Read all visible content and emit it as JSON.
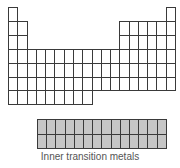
{
  "diagram": {
    "main_table": {
      "columns": 18,
      "rows": 7,
      "origin": {
        "x": 8,
        "y": 7
      },
      "cell_width": 9.28,
      "cell_height": 13.9,
      "cell_fill": "#ffffff",
      "line_color": "#3a3a3a",
      "row_layout": [
        {
          "period": 1,
          "columns": [
            1,
            18
          ]
        },
        {
          "period": 2,
          "columns": [
            1,
            2,
            13,
            14,
            15,
            16,
            17,
            18
          ]
        },
        {
          "period": 3,
          "columns": [
            1,
            2,
            13,
            14,
            15,
            16,
            17,
            18
          ]
        },
        {
          "period": 4,
          "columns": [
            1,
            2,
            3,
            4,
            5,
            6,
            7,
            8,
            9,
            10,
            11,
            12,
            13,
            14,
            15,
            16,
            17,
            18
          ]
        },
        {
          "period": 5,
          "columns": [
            1,
            2,
            3,
            4,
            5,
            6,
            7,
            8,
            9,
            10,
            11,
            12,
            13,
            14,
            15,
            16,
            17,
            18
          ]
        },
        {
          "period": 6,
          "columns": [
            1,
            2,
            3,
            4,
            5,
            6,
            7,
            8,
            9,
            10,
            11,
            12,
            13,
            14,
            15,
            16,
            17,
            18
          ]
        },
        {
          "period": 7,
          "columns": [
            1,
            2,
            3,
            4,
            5,
            6,
            7,
            8,
            9
          ]
        }
      ]
    },
    "inner_block": {
      "columns": 14,
      "rows": 2,
      "origin": {
        "x": 37,
        "y": 119
      },
      "cell_width": 9.2,
      "cell_height": 14.5,
      "cell_fill": "#c6c6c6",
      "line_color": "#3a3a3a"
    },
    "caption": "Inner transition metals"
  }
}
